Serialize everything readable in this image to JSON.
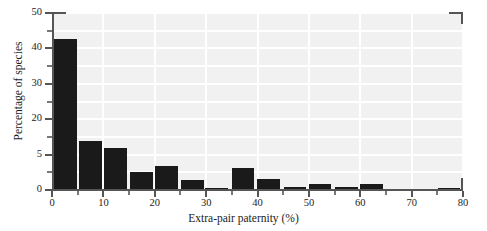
{
  "chart_data": {
    "type": "bar",
    "title": "",
    "subtitle": "",
    "xlabel": "Extra-pair paternity (%)",
    "ylabel": "Percentage of species",
    "xlim": [
      0,
      80
    ],
    "ylim": [
      0,
      50
    ],
    "grid": true,
    "legend": null,
    "bar_width_units": 4.4,
    "x_tick_labels": [
      "0",
      "10",
      "20",
      "30",
      "40",
      "50",
      "60",
      "70",
      "80"
    ],
    "x_tick_values": [
      0,
      10,
      20,
      30,
      40,
      50,
      60,
      70,
      80
    ],
    "x_minor_tick_values": [
      5,
      15,
      25,
      35,
      45,
      55,
      65,
      75
    ],
    "y_tick_labels": [
      "0",
      "5",
      "20",
      "30",
      "40",
      "50"
    ],
    "y_tick_values": [
      0,
      10,
      20,
      30,
      40,
      50
    ],
    "y_minor_tick_values": [
      5,
      15,
      25,
      35,
      45
    ],
    "bin_centers": [
      2.6,
      7.5,
      12.4,
      17.4,
      22.3,
      27.3,
      32.0,
      37.2,
      42.1,
      47.3,
      52.2,
      57.3,
      62.2,
      67.3,
      77.3
    ],
    "categories": [
      "0-5",
      "5-10",
      "10-15",
      "15-20",
      "20-25",
      "25-30",
      "30-35",
      "35-40",
      "40-45",
      "45-50",
      "50-55",
      "55-60",
      "60-65",
      "65-70",
      "75-80"
    ],
    "values": [
      42.6,
      13.8,
      12.0,
      5.2,
      6.7,
      2.9,
      0.7,
      6.2,
      3.1,
      0.9,
      1.7,
      0.8,
      1.6,
      0.0,
      0.6
    ],
    "bar_color": "#1a1a1a",
    "plot_background": "#f1f1f1",
    "gridline_color": "#ffffff",
    "axis_color": "#555555"
  }
}
